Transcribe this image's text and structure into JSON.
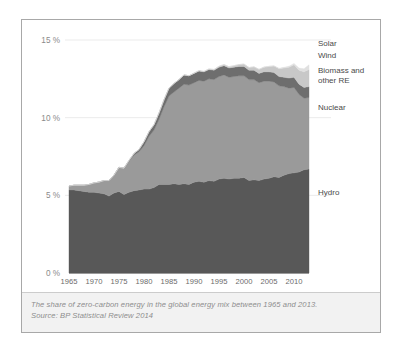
{
  "figure": {
    "caption_line1": "The share of zero-carbon energy in the global energy mix between 1965 and 2013.",
    "caption_line2": "Source: BP Statistical Review 2014"
  },
  "chart_data": {
    "type": "area",
    "title": "",
    "subtitle": "",
    "xlabel": "",
    "ylabel": "",
    "stacked": true,
    "grid": true,
    "legend_position": "right-inline",
    "xlim": [
      1965,
      2013
    ],
    "ylim": [
      0,
      15
    ],
    "y_tick_labels": [
      "0 %",
      "5 %",
      "10 %",
      "15 %"
    ],
    "y_ticks": [
      0,
      5,
      10,
      15
    ],
    "x_tick_labels": [
      "1965",
      "1970",
      "1975",
      "1980",
      "1985",
      "1990",
      "1995",
      "2000",
      "2005",
      "2010"
    ],
    "x_ticks": [
      1965,
      1970,
      1975,
      1980,
      1985,
      1990,
      1995,
      2000,
      2005,
      2010
    ],
    "x": [
      1965,
      1966,
      1967,
      1968,
      1969,
      1970,
      1971,
      1972,
      1973,
      1974,
      1975,
      1976,
      1977,
      1978,
      1979,
      1980,
      1981,
      1982,
      1983,
      1984,
      1985,
      1986,
      1987,
      1988,
      1989,
      1990,
      1991,
      1992,
      1993,
      1994,
      1995,
      1996,
      1997,
      1998,
      1999,
      2000,
      2001,
      2002,
      2003,
      2004,
      2005,
      2006,
      2007,
      2008,
      2009,
      2010,
      2011,
      2012,
      2013
    ],
    "colors": {
      "hydro": "#585858",
      "nuclear": "#9a9a9a",
      "biomass": "#6e6e6e",
      "wind": "#c8c8c8",
      "solar": "#e0e0e0"
    },
    "series": [
      {
        "name": "Hydro",
        "color": "#585858",
        "values": [
          5.35,
          5.35,
          5.3,
          5.25,
          5.2,
          5.2,
          5.15,
          5.1,
          4.95,
          5.15,
          5.25,
          5.05,
          5.2,
          5.3,
          5.35,
          5.4,
          5.4,
          5.5,
          5.7,
          5.7,
          5.7,
          5.75,
          5.7,
          5.75,
          5.7,
          5.85,
          5.9,
          5.85,
          5.95,
          5.9,
          6.05,
          6.1,
          6.05,
          6.1,
          6.1,
          6.15,
          5.95,
          6.0,
          5.95,
          6.05,
          6.1,
          6.2,
          6.15,
          6.3,
          6.4,
          6.45,
          6.5,
          6.65,
          6.7
        ]
      },
      {
        "name": "Nuclear",
        "color": "#9a9a9a",
        "values": [
          0.25,
          0.3,
          0.35,
          0.4,
          0.5,
          0.6,
          0.7,
          0.85,
          1.0,
          1.15,
          1.55,
          1.7,
          2.0,
          2.3,
          2.45,
          2.8,
          3.4,
          3.7,
          4.2,
          5.0,
          5.7,
          5.9,
          6.2,
          6.4,
          6.4,
          6.4,
          6.5,
          6.5,
          6.55,
          6.55,
          6.6,
          6.65,
          6.55,
          6.55,
          6.6,
          6.55,
          6.5,
          6.45,
          6.3,
          6.3,
          6.25,
          6.1,
          5.9,
          5.7,
          5.5,
          5.5,
          5.0,
          4.6,
          4.6
        ]
      },
      {
        "name": "Biomass and other RE",
        "color": "#6e6e6e",
        "values": [
          0.0,
          0.0,
          0.0,
          0.0,
          0.0,
          0.0,
          0.0,
          0.0,
          0.0,
          0.0,
          0.0,
          0.0,
          0.05,
          0.1,
          0.15,
          0.25,
          0.3,
          0.35,
          0.4,
          0.45,
          0.5,
          0.55,
          0.55,
          0.6,
          0.6,
          0.6,
          0.6,
          0.6,
          0.6,
          0.6,
          0.6,
          0.6,
          0.6,
          0.6,
          0.6,
          0.6,
          0.6,
          0.6,
          0.6,
          0.6,
          0.6,
          0.6,
          0.6,
          0.6,
          0.65,
          0.65,
          0.65,
          0.7,
          0.7
        ]
      },
      {
        "name": "Wind",
        "color": "#c8c8c8",
        "values": [
          0.0,
          0.0,
          0.0,
          0.0,
          0.0,
          0.0,
          0.0,
          0.0,
          0.0,
          0.0,
          0.0,
          0.0,
          0.0,
          0.0,
          0.0,
          0.0,
          0.0,
          0.0,
          0.0,
          0.0,
          0.0,
          0.0,
          0.0,
          0.0,
          0.0,
          0.02,
          0.03,
          0.03,
          0.04,
          0.05,
          0.06,
          0.07,
          0.08,
          0.1,
          0.12,
          0.15,
          0.18,
          0.22,
          0.26,
          0.3,
          0.35,
          0.42,
          0.5,
          0.6,
          0.7,
          0.8,
          0.9,
          1.0,
          1.1
        ]
      },
      {
        "name": "Solar",
        "color": "#e0e0e0",
        "values": [
          0.0,
          0.0,
          0.0,
          0.0,
          0.0,
          0.0,
          0.0,
          0.0,
          0.0,
          0.0,
          0.0,
          0.0,
          0.0,
          0.0,
          0.0,
          0.0,
          0.0,
          0.0,
          0.0,
          0.0,
          0.0,
          0.0,
          0.0,
          0.0,
          0.0,
          0.0,
          0.0,
          0.0,
          0.0,
          0.0,
          0.0,
          0.0,
          0.0,
          0.0,
          0.0,
          0.0,
          0.0,
          0.0,
          0.0,
          0.01,
          0.01,
          0.02,
          0.03,
          0.04,
          0.06,
          0.09,
          0.14,
          0.2,
          0.3
        ]
      }
    ],
    "annotations": [
      {
        "label": "Solar",
        "series": "Solar"
      },
      {
        "label": "Wind",
        "series": "Wind"
      },
      {
        "label": "Biomass and",
        "series": "Biomass and other RE"
      },
      {
        "label": "other RE",
        "series": "Biomass and other RE"
      },
      {
        "label": "Nuclear",
        "series": "Nuclear"
      },
      {
        "label": "Hydro",
        "series": "Hydro"
      }
    ]
  }
}
